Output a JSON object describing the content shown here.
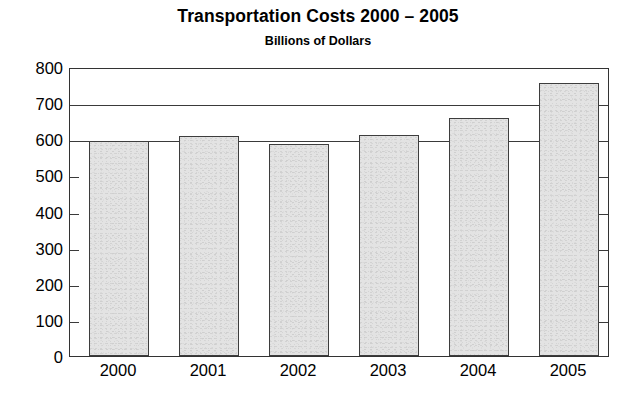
{
  "chart_data": {
    "type": "bar",
    "title": "Transportation Costs 2000 – 2005",
    "subtitle": "Billions of Dollars",
    "xlabel": "",
    "ylabel": "Billions of Dollars",
    "categories": [
      "2000",
      "2001",
      "2002",
      "2003",
      "2004",
      "2005"
    ],
    "values": [
      595,
      608,
      588,
      612,
      660,
      757
    ],
    "ylim": [
      0,
      800
    ],
    "ytick_labels": [
      "0",
      "100",
      "200",
      "300",
      "400",
      "500",
      "600",
      "700",
      "800"
    ],
    "ytick_values": [
      0,
      100,
      200,
      300,
      400,
      500,
      600,
      700,
      800
    ],
    "gridlines_at": [
      600,
      700
    ],
    "grid": "horizontal-partial",
    "legend": "none",
    "bar_fill_color": "#e3e3e3",
    "bar_border_color": "#3d3d3d",
    "axis_color": "#333333",
    "background_color": "#ffffff"
  }
}
